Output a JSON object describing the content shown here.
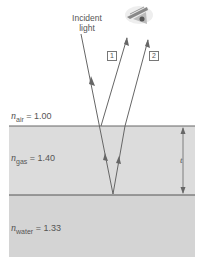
{
  "diagram": {
    "incident_label_line1": "Incident",
    "incident_label_line2": "light",
    "ray_labels": [
      "1",
      "2"
    ],
    "thickness_label": "t",
    "media": [
      {
        "symbol": "n",
        "subscript": "air",
        "value": "= 1.00"
      },
      {
        "symbol": "n",
        "subscript": "gas",
        "value": "= 1.40"
      },
      {
        "symbol": "n",
        "subscript": "water",
        "value": "= 1.33"
      }
    ],
    "icons": {
      "eye": "eye-icon"
    },
    "colors": {
      "film": "#d9d9d9",
      "water": "#d3d3d3",
      "ray": "#666666",
      "interface": "#555555"
    }
  }
}
